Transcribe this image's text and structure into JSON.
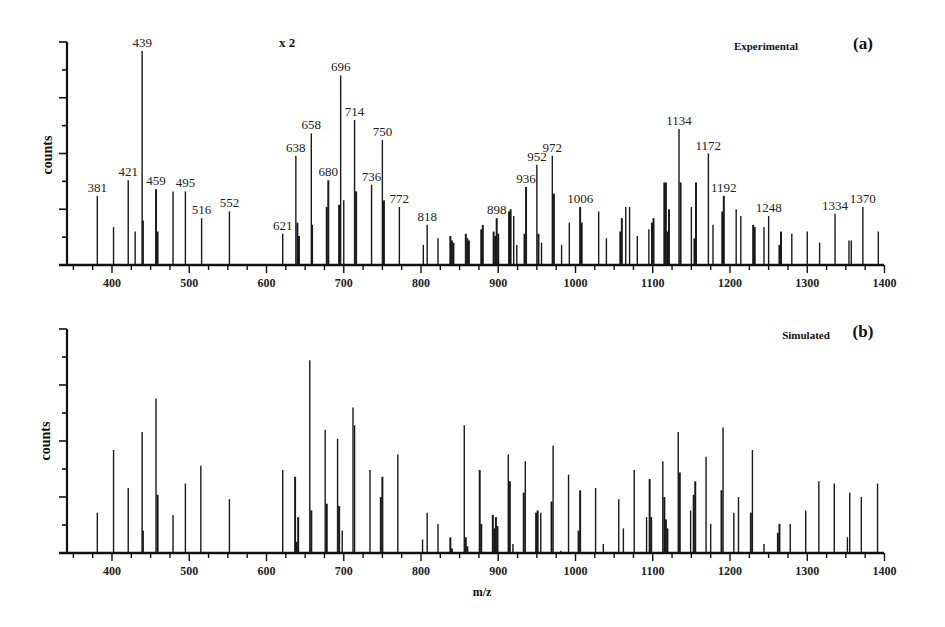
{
  "figure": {
    "x_axis_title": "m/z",
    "y_axis_title": "counts"
  },
  "panels": [
    {
      "id": "a",
      "title": "Experimental",
      "letter": "(a)",
      "scale_note": "x 2"
    },
    {
      "id": "b",
      "title": "Simulated",
      "letter": "(b)"
    }
  ],
  "chart_data": [
    {
      "type": "bar",
      "subtype": "stick-spectrum",
      "title": "Experimental",
      "panel_label": "(a)",
      "annotation": "x 2",
      "xlabel": "m/z",
      "ylabel": "counts",
      "xlim": [
        342,
        1400
      ],
      "ylim": [
        0,
        100
      ],
      "x_ticks": [
        400,
        500,
        600,
        700,
        800,
        900,
        1000,
        1100,
        1200,
        1300,
        1400
      ],
      "y_ticks_unlabeled": true,
      "grid": false,
      "peaks": [
        {
          "mz": 381,
          "intensity": 31,
          "label": "381"
        },
        {
          "mz": 402,
          "intensity": 17
        },
        {
          "mz": 421,
          "intensity": 38,
          "label": "421"
        },
        {
          "mz": 430,
          "intensity": 15
        },
        {
          "mz": 439,
          "intensity": 96,
          "label": "439"
        },
        {
          "mz": 440,
          "intensity": 20
        },
        {
          "mz": 457,
          "intensity": 34,
          "label": "459"
        },
        {
          "mz": 459,
          "intensity": 15
        },
        {
          "mz": 479,
          "intensity": 33
        },
        {
          "mz": 495,
          "intensity": 33,
          "label": "495"
        },
        {
          "mz": 516,
          "intensity": 21,
          "label": "516"
        },
        {
          "mz": 552,
          "intensity": 24,
          "label": "552"
        },
        {
          "mz": 621,
          "intensity": 14,
          "label": "621"
        },
        {
          "mz": 638,
          "intensity": 49,
          "label": "638"
        },
        {
          "mz": 640,
          "intensity": 19
        },
        {
          "mz": 642,
          "intensity": 13
        },
        {
          "mz": 658,
          "intensity": 59,
          "label": "658"
        },
        {
          "mz": 659,
          "intensity": 18
        },
        {
          "mz": 678,
          "intensity": 26
        },
        {
          "mz": 680,
          "intensity": 38,
          "label": "680"
        },
        {
          "mz": 694,
          "intensity": 27
        },
        {
          "mz": 696,
          "intensity": 85,
          "label": "696"
        },
        {
          "mz": 700,
          "intensity": 29
        },
        {
          "mz": 714,
          "intensity": 65,
          "label": "714"
        },
        {
          "mz": 716,
          "intensity": 33
        },
        {
          "mz": 736,
          "intensity": 36,
          "label": "736"
        },
        {
          "mz": 750,
          "intensity": 56,
          "label": "750"
        },
        {
          "mz": 752,
          "intensity": 29
        },
        {
          "mz": 772,
          "intensity": 26,
          "label": "772"
        },
        {
          "mz": 803,
          "intensity": 9
        },
        {
          "mz": 808,
          "intensity": 18,
          "label": "818"
        },
        {
          "mz": 822,
          "intensity": 12
        },
        {
          "mz": 838,
          "intensity": 13
        },
        {
          "mz": 840,
          "intensity": 11
        },
        {
          "mz": 842,
          "intensity": 10
        },
        {
          "mz": 858,
          "intensity": 14
        },
        {
          "mz": 860,
          "intensity": 12
        },
        {
          "mz": 862,
          "intensity": 11
        },
        {
          "mz": 878,
          "intensity": 16
        },
        {
          "mz": 880,
          "intensity": 18
        },
        {
          "mz": 894,
          "intensity": 15
        },
        {
          "mz": 896,
          "intensity": 13
        },
        {
          "mz": 898,
          "intensity": 21,
          "label": "898"
        },
        {
          "mz": 900,
          "intensity": 14
        },
        {
          "mz": 914,
          "intensity": 24
        },
        {
          "mz": 916,
          "intensity": 25
        },
        {
          "mz": 920,
          "intensity": 22
        },
        {
          "mz": 924,
          "intensity": 9
        },
        {
          "mz": 934,
          "intensity": 14
        },
        {
          "mz": 936,
          "intensity": 35,
          "label": "936"
        },
        {
          "mz": 950,
          "intensity": 45,
          "label": "952"
        },
        {
          "mz": 952,
          "intensity": 14
        },
        {
          "mz": 956,
          "intensity": 10
        },
        {
          "mz": 970,
          "intensity": 49,
          "label": "972"
        },
        {
          "mz": 972,
          "intensity": 32
        },
        {
          "mz": 982,
          "intensity": 9
        },
        {
          "mz": 992,
          "intensity": 19
        },
        {
          "mz": 1006,
          "intensity": 26,
          "label": "1006"
        },
        {
          "mz": 1008,
          "intensity": 19
        },
        {
          "mz": 1030,
          "intensity": 24
        },
        {
          "mz": 1040,
          "intensity": 12
        },
        {
          "mz": 1058,
          "intensity": 15
        },
        {
          "mz": 1060,
          "intensity": 21
        },
        {
          "mz": 1065,
          "intensity": 26
        },
        {
          "mz": 1070,
          "intensity": 26
        },
        {
          "mz": 1080,
          "intensity": 13
        },
        {
          "mz": 1095,
          "intensity": 16
        },
        {
          "mz": 1099,
          "intensity": 19
        },
        {
          "mz": 1101,
          "intensity": 21
        },
        {
          "mz": 1115,
          "intensity": 37
        },
        {
          "mz": 1117,
          "intensity": 37
        },
        {
          "mz": 1119,
          "intensity": 15
        },
        {
          "mz": 1121,
          "intensity": 25
        },
        {
          "mz": 1134,
          "intensity": 61,
          "label": "1134"
        },
        {
          "mz": 1136,
          "intensity": 37
        },
        {
          "mz": 1150,
          "intensity": 26
        },
        {
          "mz": 1154,
          "intensity": 12
        },
        {
          "mz": 1156,
          "intensity": 37
        },
        {
          "mz": 1172,
          "intensity": 50,
          "label": "1172"
        },
        {
          "mz": 1178,
          "intensity": 18
        },
        {
          "mz": 1190,
          "intensity": 24
        },
        {
          "mz": 1192,
          "intensity": 31,
          "label": "1192"
        },
        {
          "mz": 1208,
          "intensity": 25
        },
        {
          "mz": 1214,
          "intensity": 22
        },
        {
          "mz": 1230,
          "intensity": 18
        },
        {
          "mz": 1232,
          "intensity": 17
        },
        {
          "mz": 1244,
          "intensity": 17
        },
        {
          "mz": 1250,
          "intensity": 22,
          "label": "1248"
        },
        {
          "mz": 1264,
          "intensity": 9
        },
        {
          "mz": 1266,
          "intensity": 15
        },
        {
          "mz": 1280,
          "intensity": 14
        },
        {
          "mz": 1300,
          "intensity": 15
        },
        {
          "mz": 1316,
          "intensity": 10
        },
        {
          "mz": 1336,
          "intensity": 23,
          "label": "1334"
        },
        {
          "mz": 1354,
          "intensity": 11
        },
        {
          "mz": 1357,
          "intensity": 11
        },
        {
          "mz": 1372,
          "intensity": 26,
          "label": "1370"
        },
        {
          "mz": 1392,
          "intensity": 15
        }
      ]
    },
    {
      "type": "bar",
      "subtype": "stick-spectrum",
      "title": "Simulated",
      "panel_label": "(b)",
      "xlabel": "m/z",
      "ylabel": "counts",
      "xlim": [
        342,
        1400
      ],
      "ylim": [
        0,
        100
      ],
      "x_ticks": [
        400,
        500,
        600,
        700,
        800,
        900,
        1000,
        1100,
        1200,
        1300,
        1400
      ],
      "y_ticks_unlabeled": true,
      "grid": false,
      "peaks": [
        {
          "mz": 381,
          "intensity": 18
        },
        {
          "mz": 402,
          "intensity": 46
        },
        {
          "mz": 421,
          "intensity": 29
        },
        {
          "mz": 439,
          "intensity": 54
        },
        {
          "mz": 440,
          "intensity": 10
        },
        {
          "mz": 457,
          "intensity": 69
        },
        {
          "mz": 459,
          "intensity": 26
        },
        {
          "mz": 479,
          "intensity": 17
        },
        {
          "mz": 495,
          "intensity": 31
        },
        {
          "mz": 515,
          "intensity": 39
        },
        {
          "mz": 552,
          "intensity": 24
        },
        {
          "mz": 621,
          "intensity": 37
        },
        {
          "mz": 637,
          "intensity": 34
        },
        {
          "mz": 639,
          "intensity": 5
        },
        {
          "mz": 641,
          "intensity": 16
        },
        {
          "mz": 656,
          "intensity": 86
        },
        {
          "mz": 658,
          "intensity": 19
        },
        {
          "mz": 676,
          "intensity": 55
        },
        {
          "mz": 678,
          "intensity": 22
        },
        {
          "mz": 692,
          "intensity": 51
        },
        {
          "mz": 694,
          "intensity": 21
        },
        {
          "mz": 698,
          "intensity": 10
        },
        {
          "mz": 712,
          "intensity": 65
        },
        {
          "mz": 714,
          "intensity": 57
        },
        {
          "mz": 734,
          "intensity": 37
        },
        {
          "mz": 748,
          "intensity": 25
        },
        {
          "mz": 750,
          "intensity": 34
        },
        {
          "mz": 770,
          "intensity": 44
        },
        {
          "mz": 802,
          "intensity": 6
        },
        {
          "mz": 808,
          "intensity": 18
        },
        {
          "mz": 822,
          "intensity": 13
        },
        {
          "mz": 838,
          "intensity": 7
        },
        {
          "mz": 840,
          "intensity": 2
        },
        {
          "mz": 856,
          "intensity": 57
        },
        {
          "mz": 858,
          "intensity": 7
        },
        {
          "mz": 860,
          "intensity": 3
        },
        {
          "mz": 876,
          "intensity": 37
        },
        {
          "mz": 878,
          "intensity": 13
        },
        {
          "mz": 893,
          "intensity": 17
        },
        {
          "mz": 895,
          "intensity": 11
        },
        {
          "mz": 897,
          "intensity": 16
        },
        {
          "mz": 899,
          "intensity": 12
        },
        {
          "mz": 913,
          "intensity": 44
        },
        {
          "mz": 915,
          "intensity": 32
        },
        {
          "mz": 919,
          "intensity": 4
        },
        {
          "mz": 933,
          "intensity": 27
        },
        {
          "mz": 935,
          "intensity": 41
        },
        {
          "mz": 949,
          "intensity": 18
        },
        {
          "mz": 951,
          "intensity": 19
        },
        {
          "mz": 955,
          "intensity": 18
        },
        {
          "mz": 969,
          "intensity": 23
        },
        {
          "mz": 971,
          "intensity": 48
        },
        {
          "mz": 981,
          "intensity": 1
        },
        {
          "mz": 991,
          "intensity": 35
        },
        {
          "mz": 1006,
          "intensity": 28
        },
        {
          "mz": 1004,
          "intensity": 10
        },
        {
          "mz": 1026,
          "intensity": 29
        },
        {
          "mz": 1036,
          "intensity": 4
        },
        {
          "mz": 1056,
          "intensity": 24
        },
        {
          "mz": 1062,
          "intensity": 11
        },
        {
          "mz": 1076,
          "intensity": 37
        },
        {
          "mz": 1092,
          "intensity": 16
        },
        {
          "mz": 1096,
          "intensity": 33
        },
        {
          "mz": 1098,
          "intensity": 16
        },
        {
          "mz": 1113,
          "intensity": 41
        },
        {
          "mz": 1115,
          "intensity": 25
        },
        {
          "mz": 1117,
          "intensity": 15
        },
        {
          "mz": 1119,
          "intensity": 11
        },
        {
          "mz": 1133,
          "intensity": 54
        },
        {
          "mz": 1135,
          "intensity": 36
        },
        {
          "mz": 1149,
          "intensity": 19
        },
        {
          "mz": 1153,
          "intensity": 26
        },
        {
          "mz": 1155,
          "intensity": 32
        },
        {
          "mz": 1169,
          "intensity": 43
        },
        {
          "mz": 1175,
          "intensity": 13
        },
        {
          "mz": 1189,
          "intensity": 28
        },
        {
          "mz": 1191,
          "intensity": 56
        },
        {
          "mz": 1205,
          "intensity": 18
        },
        {
          "mz": 1211,
          "intensity": 25
        },
        {
          "mz": 1227,
          "intensity": 18
        },
        {
          "mz": 1229,
          "intensity": 46
        },
        {
          "mz": 1244,
          "intensity": 4
        },
        {
          "mz": 1262,
          "intensity": 9
        },
        {
          "mz": 1264,
          "intensity": 13
        },
        {
          "mz": 1278,
          "intensity": 13
        },
        {
          "mz": 1298,
          "intensity": 19
        },
        {
          "mz": 1315,
          "intensity": 32
        },
        {
          "mz": 1335,
          "intensity": 31
        },
        {
          "mz": 1352,
          "intensity": 7
        },
        {
          "mz": 1355,
          "intensity": 27
        },
        {
          "mz": 1370,
          "intensity": 25
        },
        {
          "mz": 1391,
          "intensity": 31
        }
      ]
    }
  ]
}
